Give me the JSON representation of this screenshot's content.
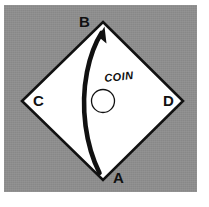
{
  "figure": {
    "background_color": "#ffffff",
    "panel_color": "#8e8e8e",
    "ink_color": "#111111",
    "shape_fill": "#ffffff"
  },
  "diamond": {
    "name": "diamond",
    "vertices": {
      "top": {
        "label": "B",
        "x": 103,
        "y": 22
      },
      "left": {
        "label": "C",
        "x": 22,
        "y": 101
      },
      "right": {
        "label": "D",
        "x": 183,
        "y": 101
      },
      "bottom": {
        "label": "A",
        "x": 103,
        "y": 180
      }
    }
  },
  "labels": {
    "a": "A",
    "b": "B",
    "c": "C",
    "d": "D",
    "coin": "COIN"
  },
  "coin": {
    "name": "coin",
    "center_x": 103,
    "center_y": 101,
    "diameter": 23
  },
  "arrow": {
    "name": "motion-arrow",
    "from_label": "A",
    "to_label": "B",
    "tail_x": 99,
    "tail_y": 173,
    "tip_x": 104,
    "tip_y": 27,
    "bulge": "left"
  }
}
